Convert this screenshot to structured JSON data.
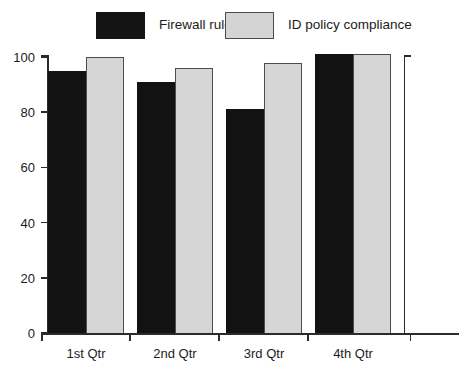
{
  "chart_data": {
    "type": "bar",
    "title": "",
    "xlabel": "",
    "ylabel": "",
    "categories": [
      "1st Qtr",
      "2nd Qtr",
      "3rd Qtr",
      "4th Qtr"
    ],
    "series": [
      {
        "name": "Firewall rules",
        "color": "#121212",
        "values": [
          95,
          91,
          81,
          101
        ]
      },
      {
        "name": "ID policy compliance",
        "color": "#d6d6d6",
        "values": [
          100,
          96,
          98,
          101
        ]
      }
    ],
    "ylim": [
      0,
      100
    ],
    "yticks": [
      0,
      20,
      40,
      60,
      80,
      100
    ],
    "ytick_labels": [
      "0",
      "20",
      "40",
      "60",
      "80",
      "100"
    ],
    "grid": false,
    "legend_position": "top",
    "bar_gap_groups": true
  },
  "legend": {
    "entries": [
      {
        "label": "Firewall rules",
        "swatch": "dark-swatch"
      },
      {
        "label": "ID policy compliance",
        "swatch": "light-swatch"
      }
    ]
  }
}
